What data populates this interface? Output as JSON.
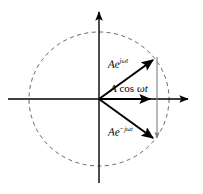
{
  "figure": {
    "type": "phasor-diagram",
    "background_color": "#ffffff",
    "width": 203,
    "height": 194
  },
  "geometry": {
    "origin": {
      "x": 99,
      "y": 99
    },
    "circle": {
      "center_x": 99,
      "center_y": 99,
      "radius_x": 70,
      "radius_y": 67,
      "stroke": "#555555",
      "stroke_width": 0.9,
      "dash": "4 3.5",
      "style": "dashed"
    },
    "axes": {
      "stroke": "#000000",
      "stroke_width": 1.4,
      "horizontal": {
        "x1": 8,
        "y1": 99,
        "x2": 192,
        "y2": 99,
        "arrow_at": "positive-x"
      },
      "vertical": {
        "x1": 99,
        "y1": 183,
        "x2": 99,
        "y2": 8,
        "arrow_at": "positive-y"
      }
    },
    "vectors": [
      {
        "id": "positive-phasor",
        "from_x": 99,
        "from_y": 99,
        "to_x": 157,
        "to_y": 57,
        "stroke": "#000000",
        "stroke_width": 2.0,
        "arrow": true
      },
      {
        "id": "resultant-phasor",
        "from_x": 99,
        "from_y": 99,
        "to_x": 156,
        "to_y": 99,
        "stroke": "#000000",
        "stroke_width": 1.9,
        "arrow": true
      },
      {
        "id": "negative-phasor",
        "from_x": 99,
        "from_y": 99,
        "to_x": 157,
        "to_y": 141,
        "stroke": "#000000",
        "stroke_width": 2.0,
        "arrow": true
      }
    ],
    "chord": {
      "id": "projection-chord",
      "x1": 157,
      "y1": 57,
      "x2": 157,
      "y2": 143,
      "stroke": "#808080",
      "stroke_width": 1.1,
      "arrow": true
    }
  },
  "labels": {
    "positive_exponential": {
      "prefix": "Ae",
      "exponent": "jωt",
      "full_text": "Ae^{jωt}",
      "x": 108,
      "y": 58
    },
    "cosine": {
      "amplitude": "A",
      "function": "cos",
      "argument": "ωt",
      "full_text": "A cos ωt",
      "x": 110,
      "y": 83
    },
    "negative_exponential": {
      "prefix": "Ae",
      "exponent": "−jωt",
      "full_text": "Ae^{−jωt}",
      "x": 108,
      "y": 126
    }
  },
  "colors": {
    "ink": "#000000",
    "dashed_circle": "#555555",
    "chord_gray": "#808080",
    "background": "#ffffff"
  }
}
